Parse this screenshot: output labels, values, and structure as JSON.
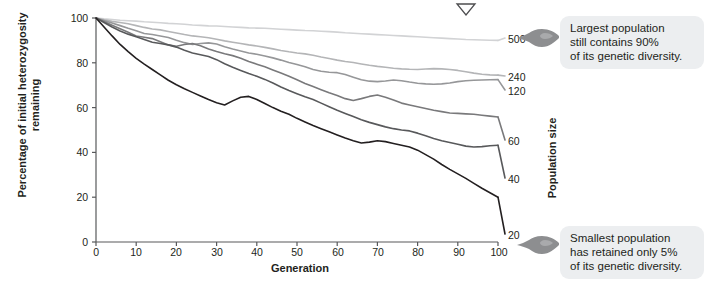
{
  "figure": {
    "title_marker": "chevron-down-marker"
  },
  "axes": {
    "y": {
      "label": "Percentage of initial heterozygosity remaining",
      "ticks": [
        "0",
        "20",
        "40",
        "60",
        "80",
        "100"
      ],
      "tick_values": [
        0,
        20,
        40,
        60,
        80,
        100
      ],
      "min": 0,
      "max": 100
    },
    "x": {
      "label": "Generation",
      "ticks": [
        "0",
        "10",
        "20",
        "30",
        "40",
        "50",
        "60",
        "70",
        "80",
        "90",
        "100"
      ],
      "tick_values": [
        0,
        10,
        20,
        30,
        40,
        50,
        60,
        70,
        80,
        90,
        100
      ],
      "min": 0,
      "max": 100
    },
    "right": {
      "label": "Population size",
      "labels": [
        "500",
        "240",
        "120",
        "60",
        "40",
        "20"
      ]
    }
  },
  "callouts": [
    {
      "name": "callout-largest",
      "icon": "pointing-hand-icon",
      "lines": [
        "Largest population",
        "still contains 90%",
        "of its genetic diversity."
      ]
    },
    {
      "name": "callout-smallest",
      "icon": "pointing-hand-icon",
      "lines": [
        "Smallest population",
        "has retained only 5%",
        "of its genetic diversity."
      ]
    }
  ],
  "colors": {
    "axis": "#58595b",
    "text": "#231f20",
    "callout_bg": "#eceef0",
    "series": [
      "#d2d3d5",
      "#b4b5b7",
      "#969799",
      "#79797b",
      "#58595b",
      "#231f20"
    ]
  },
  "chart_data": {
    "type": "line",
    "title": "",
    "xlabel": "Generation",
    "ylabel": "Percentage of initial heterozygosity remaining",
    "xlim": [
      0,
      100
    ],
    "ylim": [
      0,
      100
    ],
    "grid": false,
    "legend_position": "right-axis-labels",
    "x": [
      0,
      2,
      4,
      6,
      8,
      10,
      12,
      14,
      16,
      18,
      20,
      22,
      24,
      26,
      28,
      30,
      32,
      34,
      36,
      38,
      40,
      42,
      44,
      46,
      48,
      50,
      52,
      54,
      56,
      58,
      60,
      62,
      64,
      66,
      68,
      70,
      72,
      74,
      76,
      78,
      80,
      82,
      84,
      86,
      88,
      90,
      92,
      94,
      96,
      98,
      100
    ],
    "series": [
      {
        "name": "500",
        "color": "#d2d3d5",
        "end_label": "500",
        "values": [
          100,
          99.6,
          99.3,
          99.0,
          98.8,
          98.6,
          98.3,
          98.1,
          97.9,
          97.6,
          97.4,
          97.2,
          96.9,
          96.7,
          96.5,
          96.4,
          96.2,
          96.0,
          95.8,
          95.6,
          95.5,
          95.4,
          95.2,
          95.0,
          94.8,
          94.6,
          94.4,
          94.3,
          94.1,
          93.9,
          93.7,
          93.4,
          93.2,
          93.0,
          92.8,
          92.6,
          92.4,
          92.2,
          92.0,
          91.8,
          91.6,
          91.4,
          91.2,
          91.0,
          90.8,
          90.6,
          90.4,
          90.3,
          90.2,
          90.1,
          90.0
        ]
      },
      {
        "name": "240",
        "color": "#b4b5b7",
        "end_label": "240",
        "values": [
          100,
          99.2,
          98.5,
          98.0,
          97.4,
          96.6,
          95.8,
          95.1,
          94.7,
          94.0,
          93.3,
          92.6,
          92.0,
          91.6,
          91.2,
          90.5,
          89.8,
          89.2,
          88.6,
          88.0,
          87.5,
          86.9,
          86.2,
          85.5,
          84.9,
          84.4,
          84.0,
          83.4,
          82.6,
          81.9,
          81.2,
          80.6,
          80.1,
          79.5,
          78.9,
          78.4,
          78.0,
          77.6,
          77.3,
          77.1,
          77.0,
          77.2,
          77.4,
          77.3,
          77.0,
          76.6,
          76.0,
          75.4,
          74.9,
          74.6,
          74.5
        ]
      },
      {
        "name": "120",
        "color": "#969799",
        "end_label": "120",
        "values": [
          100,
          98.9,
          97.8,
          96.6,
          95.4,
          94.3,
          93.1,
          92.6,
          92.0,
          91.3,
          90.1,
          89.0,
          88.2,
          88.6,
          88.9,
          88.4,
          87.2,
          86.2,
          85.3,
          84.4,
          83.8,
          83.0,
          82.2,
          81.2,
          80.1,
          79.2,
          78.2,
          77.0,
          76.2,
          75.8,
          75.6,
          74.8,
          73.6,
          72.4,
          71.8,
          71.6,
          71.9,
          72.3,
          72.0,
          71.4,
          70.9,
          70.6,
          70.4,
          70.6,
          71.0,
          71.6,
          72.0,
          72.2,
          72.3,
          72.4,
          72.5
        ]
      },
      {
        "name": "60",
        "color": "#79797b",
        "end_label": "60",
        "values": [
          100,
          98.4,
          96.8,
          95.2,
          93.6,
          92.0,
          91.4,
          90.8,
          89.4,
          88.0,
          87.4,
          88.2,
          88.6,
          87.6,
          86.2,
          85.0,
          84.0,
          83.2,
          82.0,
          80.6,
          79.4,
          78.2,
          76.8,
          75.4,
          74.0,
          72.4,
          70.8,
          69.4,
          68.0,
          66.6,
          65.4,
          64.0,
          63.2,
          64.0,
          65.0,
          65.6,
          64.6,
          63.4,
          62.0,
          61.2,
          60.4,
          59.6,
          58.8,
          58.2,
          57.6,
          57.4,
          57.2,
          57.0,
          56.6,
          56.2,
          55.8
        ]
      },
      {
        "name": "40",
        "color": "#58595b",
        "end_label": "40",
        "values": [
          100,
          98.0,
          96.0,
          94.2,
          92.8,
          91.6,
          90.4,
          89.2,
          88.6,
          88.0,
          87.0,
          85.6,
          84.4,
          83.6,
          82.8,
          81.4,
          79.6,
          78.0,
          76.6,
          75.2,
          74.0,
          72.6,
          71.0,
          69.2,
          67.6,
          66.2,
          64.8,
          63.6,
          62.0,
          60.4,
          58.8,
          57.4,
          56.0,
          54.6,
          53.4,
          52.4,
          51.4,
          50.6,
          50.0,
          49.6,
          48.6,
          47.4,
          46.2,
          45.2,
          44.4,
          43.6,
          42.8,
          42.4,
          42.6,
          43.0,
          43.2
        ]
      },
      {
        "name": "20",
        "color": "#231f20",
        "end_label": "20",
        "values": [
          100,
          96.0,
          92.0,
          88.2,
          85.0,
          82.0,
          79.4,
          77.0,
          74.6,
          72.2,
          70.2,
          68.4,
          66.8,
          65.2,
          63.6,
          62.2,
          61.2,
          63.0,
          64.6,
          65.0,
          63.6,
          61.8,
          60.0,
          58.4,
          57.0,
          55.2,
          53.6,
          52.0,
          50.6,
          49.2,
          47.8,
          46.4,
          45.2,
          44.2,
          44.6,
          45.2,
          44.8,
          44.0,
          43.2,
          42.4,
          41.0,
          39.0,
          37.0,
          34.6,
          32.4,
          30.4,
          28.4,
          26.2,
          24.0,
          22.0,
          20.0
        ]
      }
    ],
    "annotations": [
      {
        "text": "Largest population still contains 90% of its genetic diversity.",
        "target": "500"
      },
      {
        "text": "Smallest population has retained only 5% of its genetic diversity.",
        "target": "20"
      }
    ]
  }
}
